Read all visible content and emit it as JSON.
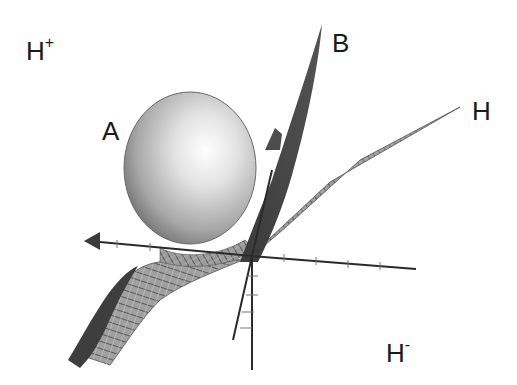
{
  "diagram": {
    "title": "",
    "labels": {
      "h_plus": {
        "base": "H",
        "sup": "+"
      },
      "h_minus": {
        "base": "H",
        "sup": "-"
      },
      "a": "A",
      "b": "B",
      "h": "H"
    },
    "elements": [
      {
        "id": "A",
        "kind": "sphere",
        "description": "shaded sphere resting above the hyperplane"
      },
      {
        "id": "B",
        "kind": "surface",
        "description": "dark curved surface rising steeply to upper right"
      },
      {
        "id": "H",
        "kind": "hyperplane",
        "description": "meshed plane separating half-spaces"
      },
      {
        "id": "axes",
        "kind": "3d-axes",
        "description": "three coordinate axes with tick marks, one with arrowhead pointing left"
      }
    ],
    "regions": [
      "H+",
      "H-"
    ],
    "colors": {
      "background": "#ffffff",
      "sphere_light": "#f4f4f4",
      "sphere_dark": "#7a7a7a",
      "surface_b": "#4a4a4a",
      "plane_h": "#8a8a8a",
      "mesh_lines": "#3a3a3a",
      "axes": "#2a2a2a",
      "text": "#1a1a1a"
    }
  }
}
